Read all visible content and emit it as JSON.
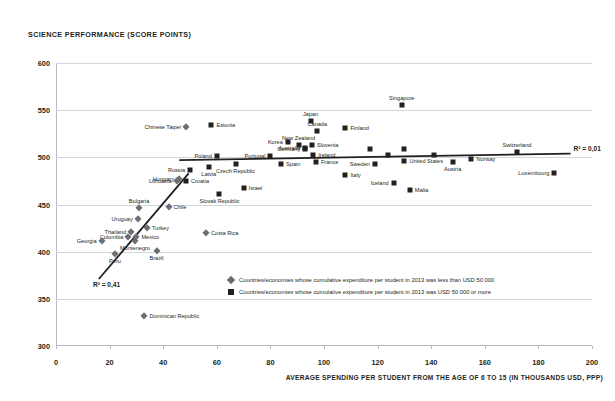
{
  "chart_data": {
    "type": "scatter",
    "title": "SCIENCE PERFORMANCE (SCORE POINTS)",
    "xlabel": "AVERAGE SPENDING PER STUDENT FROM THE AGE OF 6 TO 15 (IN THOUSANDS USD,  PPP)",
    "ylabel": "SCIENCE PERFORMANCE (SCORE POINTS)",
    "xlim": [
      0,
      200
    ],
    "ylim": [
      300,
      600
    ],
    "xticks": [
      0,
      20,
      40,
      60,
      80,
      100,
      120,
      140,
      160,
      180,
      200
    ],
    "yticks": [
      300,
      350,
      400,
      450,
      500,
      550,
      600
    ],
    "grid": "horizontal",
    "legend_position": "inside-bottom-center",
    "series": [
      {
        "name": "low-expenditure",
        "marker": "diamond",
        "color": "#6c6f72",
        "legend": "Countries/economies whose cumulative expenditure per student in 2013 was less than USD 50 000",
        "points": [
          {
            "label": "Chinese Taipei",
            "x": 48.5,
            "y": 532,
            "pos": "l"
          },
          {
            "label": "Costa Rica",
            "x": 56.0,
            "y": 420,
            "pos": "r"
          },
          {
            "label": "Chile",
            "x": 42.0,
            "y": 447,
            "pos": "r"
          },
          {
            "label": "Bulgaria",
            "x": 31.0,
            "y": 446,
            "pos": "c"
          },
          {
            "label": "Uruguay",
            "x": 30.5,
            "y": 435,
            "pos": "l"
          },
          {
            "label": "Turkey",
            "x": 34.0,
            "y": 425,
            "pos": "r"
          },
          {
            "label": "Thailand",
            "x": 28.0,
            "y": 421,
            "pos": "l"
          },
          {
            "label": "Colombia",
            "x": 27.0,
            "y": 416,
            "pos": "l"
          },
          {
            "label": "Mexico",
            "x": 30.0,
            "y": 416,
            "pos": "r"
          },
          {
            "label": "Montenegro",
            "x": 29.5,
            "y": 411,
            "pos": "cb"
          },
          {
            "label": "Georgia",
            "x": 17.0,
            "y": 411,
            "pos": "l"
          },
          {
            "label": "Peru",
            "x": 22.0,
            "y": 397,
            "pos": "cb"
          },
          {
            "label": "Brazil",
            "x": 37.5,
            "y": 401,
            "pos": "cb"
          },
          {
            "label": "Dominican Republic",
            "x": 33.0,
            "y": 332,
            "pos": "r"
          },
          {
            "label": "Lithuania",
            "x": 45.0,
            "y": 475,
            "pos": "l"
          },
          {
            "label": "Hungary",
            "x": 46.0,
            "y": 477,
            "pos": "l"
          }
        ]
      },
      {
        "name": "high-expenditure",
        "marker": "square",
        "color": "#231f20",
        "legend": "Countries/economies whose cumulative expenditure per student in 2013 was USD 50 000 or more",
        "points": [
          {
            "label": "Singapore",
            "x": 129.0,
            "y": 556,
            "pos": "c"
          },
          {
            "label": "Japan",
            "x": 95.0,
            "y": 538,
            "pos": "c"
          },
          {
            "label": "Estonia",
            "x": 58.0,
            "y": 534,
            "pos": "r"
          },
          {
            "label": "Canada",
            "x": 97.5,
            "y": 528,
            "pos": "c"
          },
          {
            "label": "Finland",
            "x": 108.0,
            "y": 531,
            "pos": "r"
          },
          {
            "label": "Korea",
            "x": 86.5,
            "y": 516,
            "pos": "l"
          },
          {
            "label": "New Zealand",
            "x": 90.5,
            "y": 513,
            "pos": "c"
          },
          {
            "label": "Australia",
            "x": 93.0,
            "y": 510,
            "pos": "l"
          },
          {
            "label": "Slovenia",
            "x": 95.5,
            "y": 513,
            "pos": "r"
          },
          {
            "label": "Germany",
            "x": 93.0,
            "y": 509,
            "pos": "l"
          },
          {
            "label": "Switzerland",
            "x": 172.0,
            "y": 506,
            "pos": "c"
          },
          {
            "label": "Poland",
            "x": 60.0,
            "y": 501,
            "pos": "l"
          },
          {
            "label": "Portugal",
            "x": 80.0,
            "y": 501,
            "pos": "l"
          },
          {
            "label": "Ireland",
            "x": 96.0,
            "y": 503,
            "pos": "r"
          },
          {
            "label": "United Kingdom",
            "x": 117.0,
            "y": 509,
            "pos": "none"
          },
          {
            "label": "Netherlands",
            "x": 130.0,
            "y": 509,
            "pos": "none"
          },
          {
            "label": "Belgium",
            "x": 124.0,
            "y": 502,
            "pos": "none"
          },
          {
            "label": "Denmark",
            "x": 141.0,
            "y": 502,
            "pos": "none"
          },
          {
            "label": "United States",
            "x": 130.0,
            "y": 496,
            "pos": "r"
          },
          {
            "label": "Norway",
            "x": 155.0,
            "y": 498,
            "pos": "r"
          },
          {
            "label": "Sweden",
            "x": 119.0,
            "y": 493,
            "pos": "l"
          },
          {
            "label": "France",
            "x": 97.0,
            "y": 495,
            "pos": "r"
          },
          {
            "label": "Austria",
            "x": 148.0,
            "y": 495,
            "pos": "cb"
          },
          {
            "label": "Spain",
            "x": 84.0,
            "y": 493,
            "pos": "r"
          },
          {
            "label": "Czech Republic",
            "x": 67.0,
            "y": 493,
            "pos": "cb"
          },
          {
            "label": "Latvia",
            "x": 57.0,
            "y": 490,
            "pos": "cb"
          },
          {
            "label": "Russia",
            "x": 50.0,
            "y": 487,
            "pos": "l"
          },
          {
            "label": "Luxembourg",
            "x": 186.0,
            "y": 483,
            "pos": "l"
          },
          {
            "label": "Croatia",
            "x": 48.5,
            "y": 475,
            "pos": "r"
          },
          {
            "label": "Italy",
            "x": 108.0,
            "y": 481,
            "pos": "r"
          },
          {
            "label": "Iceland",
            "x": 126.0,
            "y": 473,
            "pos": "l"
          },
          {
            "label": "Israel",
            "x": 70.0,
            "y": 467,
            "pos": "r"
          },
          {
            "label": "Malta",
            "x": 132.0,
            "y": 465,
            "pos": "r"
          },
          {
            "label": "Slovak Republic",
            "x": 61.0,
            "y": 461,
            "pos": "cb"
          }
        ]
      }
    ],
    "trendlines": [
      {
        "name": "low-expenditure-trend",
        "r2_label": "R² = 0,41",
        "r2_value": 0.41,
        "x1": 16.0,
        "y1": 371,
        "x2": 49.5,
        "y2": 483
      },
      {
        "name": "high-expenditure-trend",
        "r2_label": "R² = 0,01",
        "r2_value": 0.01,
        "x1": 46.0,
        "y1": 497,
        "x2": 192.0,
        "y2": 504
      }
    ]
  }
}
